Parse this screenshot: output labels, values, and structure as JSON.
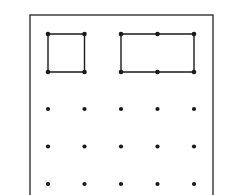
{
  "diagram": {
    "type": "dot-grid",
    "rows": 5,
    "columns": 5,
    "colors": {
      "ink": "#1a1a1a",
      "background": "#ffffff"
    },
    "frame": {
      "x": 30,
      "y": 15,
      "width": 183,
      "height": 190
    },
    "grid": {
      "x": [
        48,
        84.5,
        121,
        157.5,
        194
      ],
      "y": [
        34,
        72,
        109,
        146.5,
        184
      ]
    },
    "shapes": [
      {
        "name": "square",
        "corners": [
          [
            0,
            0
          ],
          [
            1,
            0
          ],
          [
            1,
            1
          ],
          [
            0,
            1
          ]
        ]
      },
      {
        "name": "rectangle",
        "corners": [
          [
            2,
            0
          ],
          [
            4,
            0
          ],
          [
            4,
            1
          ],
          [
            2,
            1
          ]
        ]
      }
    ]
  }
}
